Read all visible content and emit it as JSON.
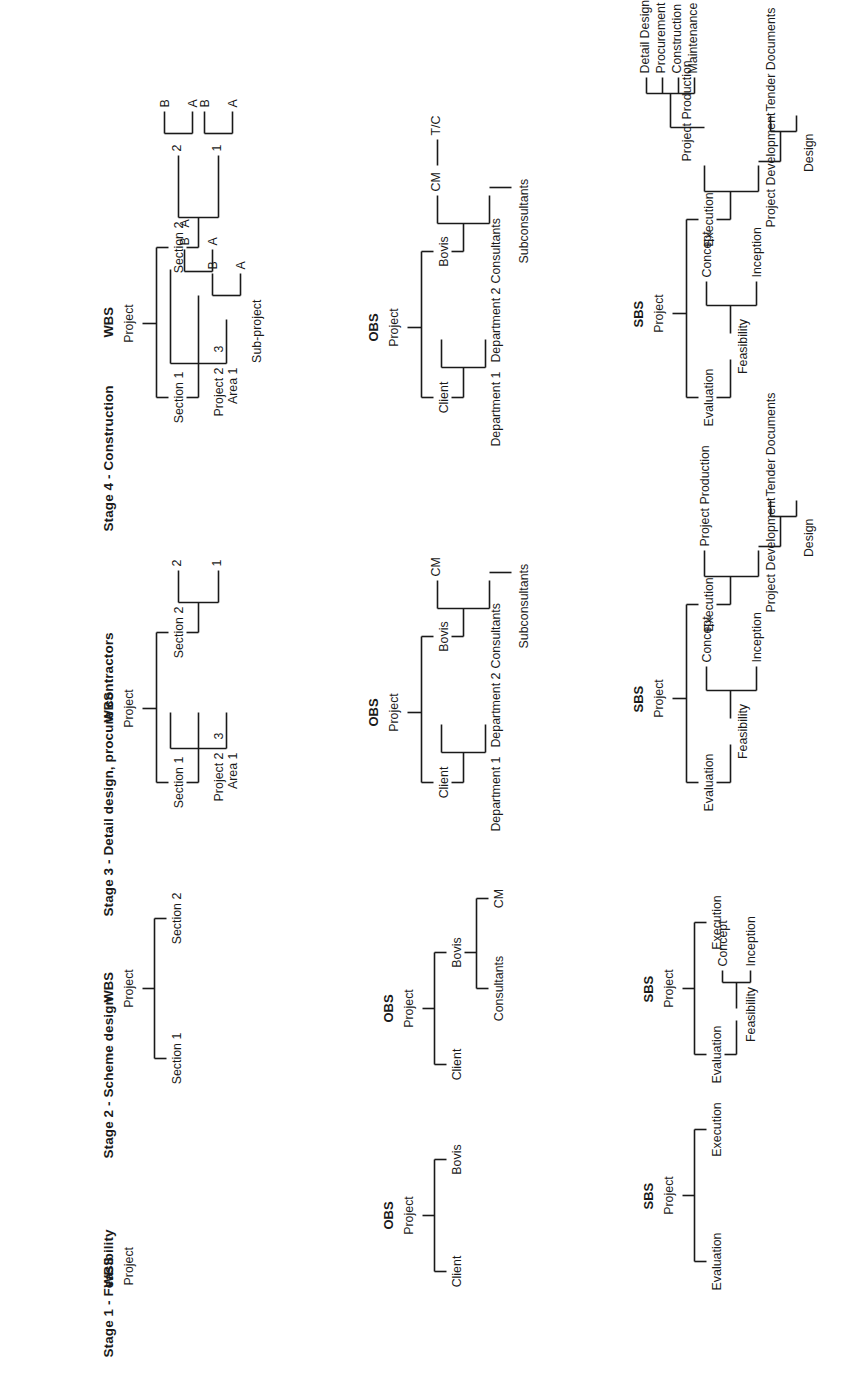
{
  "document": {
    "orientation": "rotated-90-ccw",
    "group_titles": {
      "wbs": "WBS",
      "obs": "OBS",
      "sbs": "SBS"
    },
    "root_label": "Project"
  },
  "stages": [
    {
      "id": "stage-1",
      "title": "Stage 1 - Feasibility",
      "wbs": {
        "title": "WBS",
        "root": "Project",
        "nodes": []
      },
      "obs": {
        "title": "OBS",
        "root": "Project",
        "nodes": [
          "Client",
          "Bovis"
        ]
      },
      "sbs": {
        "title": "SBS",
        "root": "Project",
        "nodes": [
          "Evaluation",
          "Execution"
        ]
      }
    },
    {
      "id": "stage-2",
      "title": "Stage 2 - Scheme design",
      "wbs": {
        "title": "WBS",
        "root": "Project",
        "nodes": [
          "Section 1",
          "Section 2"
        ]
      },
      "obs": {
        "title": "OBS",
        "root": "Project",
        "nodes": [
          "Client",
          "Bovis"
        ],
        "bovis_children": [
          "Consultants",
          "CM"
        ]
      },
      "sbs": {
        "title": "SBS",
        "root": "Project",
        "nodes": [
          "Evaluation",
          "Execution"
        ],
        "evaluation_child": "Feasibility",
        "feasibility_children": [
          "Inception",
          "Concept"
        ]
      }
    },
    {
      "id": "stage-3",
      "title": "Stage 3 - Detail design, procure contractors",
      "wbs": {
        "title": "WBS",
        "root": "Project",
        "sections": [
          {
            "label": "Section 1",
            "children": [
              "Area 1",
              "Project 2",
              "3"
            ]
          },
          {
            "label": "Section 2",
            "children": [
              "1",
              "2"
            ]
          }
        ]
      },
      "obs": {
        "title": "OBS",
        "root": "Project",
        "client": "Client",
        "client_children": [
          "Department 1",
          "Department 2"
        ],
        "bovis": "Bovis",
        "bovis_children": [
          "Consultants",
          "CM"
        ],
        "consultants_child": "Subconsultants"
      },
      "sbs": {
        "title": "SBS",
        "root": "Project",
        "evaluation": "Evaluation",
        "evaluation_child": "Feasibility",
        "feasibility_children": [
          "Inception",
          "Concept"
        ],
        "execution": "Execution",
        "execution_children": [
          "Project Development",
          "Project Production"
        ],
        "development_children": [
          "Design",
          "Tender Documents"
        ]
      }
    },
    {
      "id": "stage-4",
      "title": "Stage 4 - Construction",
      "wbs": {
        "title": "WBS",
        "root": "Project",
        "sub_project_label": "Sub-project",
        "sections": [
          {
            "label": "Section 1",
            "children": [
              {
                "label": "Area 1",
                "subs": [
                  "A",
                  "B"
                ]
              },
              {
                "label": "Project 2",
                "subs": [
                  "A",
                  "B"
                ]
              },
              {
                "label": "3",
                "subs": [
                  "A"
                ]
              }
            ]
          },
          {
            "label": "Section 2",
            "children": [
              {
                "label": "1",
                "subs": [
                  "A",
                  "B"
                ]
              },
              {
                "label": "2",
                "subs": [
                  "A",
                  "B"
                ]
              }
            ]
          }
        ]
      },
      "obs": {
        "title": "OBS",
        "root": "Project",
        "client": "Client",
        "client_children": [
          "Department 1",
          "Department 2"
        ],
        "bovis": "Bovis",
        "bovis_children": [
          "Consultants",
          "CM"
        ],
        "consultants_child": "Subconsultants",
        "cm_child": "T/C"
      },
      "sbs": {
        "title": "SBS",
        "root": "Project",
        "evaluation": "Evaluation",
        "evaluation_child": "Feasibility",
        "feasibility_children": [
          "Inception",
          "Concept"
        ],
        "execution": "Execution",
        "execution_children": [
          "Project Development",
          "Project Production"
        ],
        "development_children": [
          "Design",
          "Tender Documents"
        ],
        "production_children": [
          "Detail Design",
          "Procurement",
          "Construction",
          "Maintenance"
        ]
      }
    }
  ],
  "colors": {
    "ink": "#1a1a1a",
    "paper": "#ffffff"
  }
}
